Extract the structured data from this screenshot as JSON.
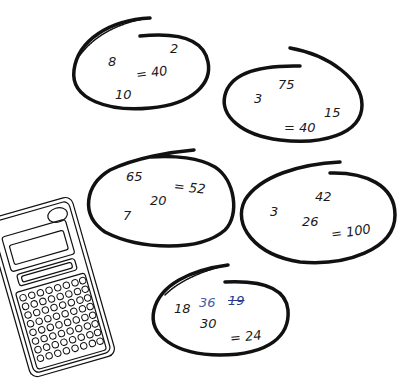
{
  "ink_colors": {
    "pencil": "#1a1a1a",
    "blue_pen": "#4a5aa8",
    "blue_correction": "#2c3a8a"
  },
  "puzzles": [
    {
      "id": 1,
      "numbers": [
        "8",
        "2",
        "10"
      ],
      "target": "= 40"
    },
    {
      "id": 2,
      "numbers": [
        "75",
        "3",
        "15"
      ],
      "target": "= 40"
    },
    {
      "id": 3,
      "numbers": [
        "65",
        "20",
        "7"
      ],
      "target": "= 52"
    },
    {
      "id": 4,
      "numbers": [
        "3",
        "42",
        "26"
      ],
      "target": "= 100"
    },
    {
      "id": 5,
      "numbers": [
        "18",
        "30"
      ],
      "handwritten": [
        "36",
        "19"
      ],
      "target": "= 24"
    }
  ],
  "illustration": {
    "object": "calculator-icon"
  }
}
